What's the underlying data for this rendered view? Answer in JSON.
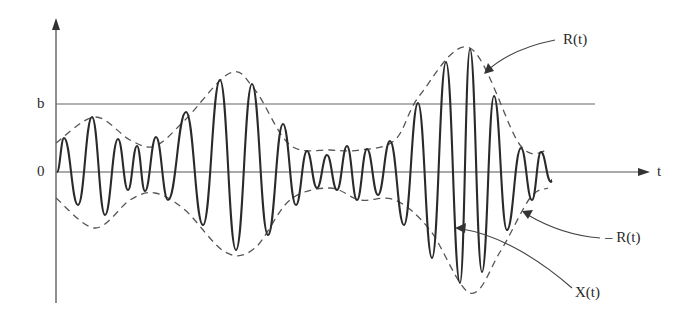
{
  "diagram": {
    "title": "",
    "axes": {
      "y_labels": {
        "b": "b",
        "zero": "0"
      },
      "x_label": "t"
    },
    "annotations": {
      "upper_envelope": "R(t)",
      "lower_envelope": "– R(t)",
      "signal": "X(t)"
    },
    "colors": {
      "ink": "#2a2a2a",
      "axis": "#555555",
      "background": "#ffffff"
    },
    "geometry": {
      "origin_x": 56,
      "zero_y": 172,
      "b_y": 104,
      "peaks": [
        [
          64,
          138
        ],
        [
          78,
          205
        ],
        [
          92,
          117
        ],
        [
          105,
          215
        ],
        [
          118,
          139
        ],
        [
          128,
          190
        ],
        [
          137,
          146
        ],
        [
          145,
          191
        ],
        [
          156,
          137
        ],
        [
          168,
          200
        ],
        [
          186,
          112
        ],
        [
          203,
          225
        ],
        [
          220,
          80
        ],
        [
          236,
          250
        ],
        [
          252,
          84
        ],
        [
          268,
          235
        ],
        [
          283,
          124
        ],
        [
          296,
          205
        ],
        [
          307,
          151
        ],
        [
          317,
          188
        ],
        [
          327,
          155
        ],
        [
          337,
          190
        ],
        [
          347,
          146
        ],
        [
          357,
          200
        ],
        [
          367,
          149
        ],
        [
          378,
          195
        ],
        [
          390,
          141
        ],
        [
          404,
          225
        ],
        [
          418,
          103
        ],
        [
          432,
          258
        ],
        [
          446,
          62
        ],
        [
          460,
          283
        ],
        [
          470,
          49
        ],
        [
          482,
          272
        ],
        [
          494,
          96
        ],
        [
          507,
          230
        ],
        [
          521,
          148
        ],
        [
          532,
          200
        ],
        [
          541,
          152
        ],
        [
          551,
          182
        ]
      ],
      "upper_env": [
        [
          56,
          143
        ],
        [
          95,
          117
        ],
        [
          130,
          140
        ],
        [
          155,
          146
        ],
        [
          185,
          120
        ],
        [
          230,
          73
        ],
        [
          255,
          90
        ],
        [
          290,
          145
        ],
        [
          330,
          150
        ],
        [
          360,
          150
        ],
        [
          395,
          140
        ],
        [
          420,
          95
        ],
        [
          470,
          48
        ],
        [
          520,
          145
        ],
        [
          548,
          150
        ]
      ],
      "lower_env": [
        [
          56,
          198
        ],
        [
          95,
          228
        ],
        [
          130,
          200
        ],
        [
          155,
          193
        ],
        [
          185,
          210
        ],
        [
          225,
          252
        ],
        [
          255,
          248
        ],
        [
          290,
          200
        ],
        [
          330,
          188
        ],
        [
          360,
          200
        ],
        [
          395,
          200
        ],
        [
          430,
          230
        ],
        [
          470,
          293
        ],
        [
          500,
          252
        ],
        [
          530,
          198
        ],
        [
          548,
          188
        ]
      ]
    }
  }
}
